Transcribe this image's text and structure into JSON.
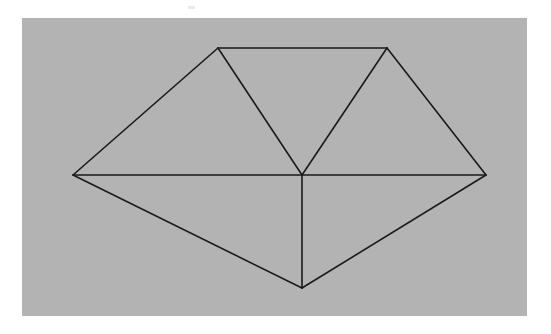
{
  "figure": {
    "canvas": {
      "width": 551,
      "height": 334,
      "background_color": "#ffffff"
    },
    "panel": {
      "name": "gray-drawing-panel",
      "x": 22,
      "y": 18,
      "width": 505,
      "height": 298,
      "fill_color": "#b3b3b3"
    },
    "stroke": {
      "color": "#1a1a1a",
      "width": 1.6
    }
  },
  "chart_data": {
    "type": "diagram",
    "xlabel": "",
    "ylabel": "",
    "grid": false,
    "legend": "none",
    "coordinate_space": {
      "x_range": [
        0,
        551
      ],
      "y_range": [
        0,
        334
      ],
      "y_axis_down": true
    },
    "vertices": [
      {
        "id": "L",
        "label": "left-vertex",
        "x": 73,
        "y": 175
      },
      {
        "id": "TL",
        "label": "top-left-vertex",
        "x": 218,
        "y": 48
      },
      {
        "id": "TR",
        "label": "top-right-vertex",
        "x": 387,
        "y": 48
      },
      {
        "id": "R",
        "label": "right-vertex",
        "x": 486,
        "y": 175
      },
      {
        "id": "C",
        "label": "center-vertex",
        "x": 302,
        "y": 175
      },
      {
        "id": "B",
        "label": "bottom-vertex",
        "x": 302,
        "y": 288
      }
    ],
    "edges": [
      {
        "id": "e1",
        "label": "left-to-top-left",
        "from": "L",
        "to": "TL",
        "kind": "boundary"
      },
      {
        "id": "e2",
        "label": "top-edge",
        "from": "TL",
        "to": "TR",
        "kind": "boundary"
      },
      {
        "id": "e3",
        "label": "top-right-to-right",
        "from": "TR",
        "to": "R",
        "kind": "boundary"
      },
      {
        "id": "e4",
        "label": "right-to-bottom",
        "from": "R",
        "to": "B",
        "kind": "boundary"
      },
      {
        "id": "e5",
        "label": "bottom-to-left",
        "from": "B",
        "to": "L",
        "kind": "boundary"
      },
      {
        "id": "e6",
        "label": "horizontal-left-chord",
        "from": "L",
        "to": "C",
        "kind": "diagonal"
      },
      {
        "id": "e7",
        "label": "horizontal-right-chord",
        "from": "C",
        "to": "R",
        "kind": "diagonal"
      },
      {
        "id": "e8",
        "label": "center-to-top-left",
        "from": "C",
        "to": "TL",
        "kind": "diagonal"
      },
      {
        "id": "e9",
        "label": "center-to-top-right",
        "from": "C",
        "to": "TR",
        "kind": "diagonal"
      },
      {
        "id": "e10",
        "label": "center-to-bottom",
        "from": "C",
        "to": "B",
        "kind": "diagonal"
      }
    ],
    "triangles": [
      {
        "id": "t1",
        "label": "upper-left-triangle",
        "vertices": [
          "L",
          "TL",
          "C"
        ]
      },
      {
        "id": "t2",
        "label": "upper-middle-triangle",
        "vertices": [
          "TL",
          "TR",
          "C"
        ]
      },
      {
        "id": "t3",
        "label": "upper-right-triangle",
        "vertices": [
          "TR",
          "R",
          "C"
        ]
      },
      {
        "id": "t4",
        "label": "lower-left-triangle",
        "vertices": [
          "L",
          "C",
          "B"
        ]
      },
      {
        "id": "t5",
        "label": "lower-right-triangle",
        "vertices": [
          "C",
          "R",
          "B"
        ]
      }
    ],
    "counts": {
      "vertices": 6,
      "edges": 10,
      "triangles": 5
    }
  },
  "artifacts": [
    {
      "name": "scan-speck",
      "x": 188,
      "y": 6,
      "width": 7,
      "height": 3,
      "color": "#d8d8d8"
    }
  ]
}
